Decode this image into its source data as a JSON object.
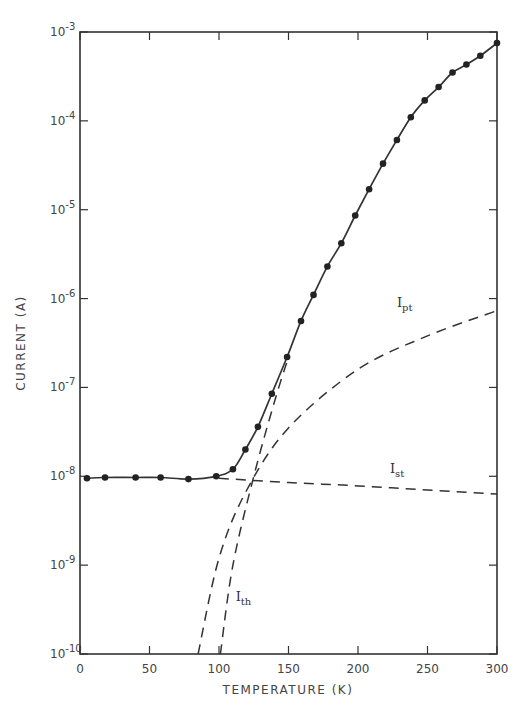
{
  "chart_data": {
    "type": "line",
    "title": "",
    "xlabel": "TEMPERATURE (K)",
    "ylabel": "CURRENT (A)",
    "xlim": [
      0,
      300
    ],
    "ylim": [
      1e-10,
      0.001
    ],
    "yscale": "log",
    "grid": false,
    "legend": "none (inline curve labels)",
    "x_ticks": [
      "0",
      "50",
      "100",
      "150",
      "200",
      "250",
      "300"
    ],
    "y_ticks": [
      {
        "base": "10",
        "exp": "-3"
      },
      {
        "base": "10",
        "exp": "-4"
      },
      {
        "base": "10",
        "exp": "-5"
      },
      {
        "base": "10",
        "exp": "-6"
      },
      {
        "base": "10",
        "exp": "-7"
      },
      {
        "base": "10",
        "exp": "-8"
      },
      {
        "base": "10",
        "exp": "-9"
      },
      {
        "base": "10",
        "exp": "-10"
      }
    ],
    "series": [
      {
        "name": "Measured (total current)",
        "style": "solid line with filled circle markers",
        "x": [
          5,
          18,
          40,
          58,
          78,
          98,
          110,
          119,
          128,
          138,
          149,
          159,
          168,
          178,
          188,
          198,
          208,
          218,
          228,
          238,
          248,
          258,
          268,
          278,
          288,
          300
        ],
        "y": [
          9.5e-09,
          9.7e-09,
          9.7e-09,
          9.7e-09,
          9.3e-09,
          1e-08,
          1.2e-08,
          2e-08,
          3.6e-08,
          8.5e-08,
          2.2e-07,
          5.6e-07,
          1.1e-06,
          2.3e-06,
          4.2e-06,
          8.6e-06,
          1.7e-05,
          3.3e-05,
          6.1e-05,
          0.00011,
          0.00017,
          0.00024,
          0.00035,
          0.00043,
          0.00054,
          0.00075
        ]
      },
      {
        "name": "I_st",
        "style": "dashed",
        "x": [
          100,
          150,
          200,
          250,
          300
        ],
        "y": [
          9.5e-09,
          8.5e-09,
          7.8e-09,
          7e-09,
          6.3e-09
        ]
      },
      {
        "name": "I_pt",
        "style": "dashed",
        "x": [
          85,
          100,
          120,
          150,
          200,
          250,
          300
        ],
        "y": [
          1e-10,
          1.2e-09,
          7e-09,
          3.5e-08,
          1.6e-07,
          3.8e-07,
          7.3e-07
        ]
      },
      {
        "name": "I_th",
        "style": "dashed",
        "x": [
          101,
          110,
          125,
          140,
          150
        ],
        "y": [
          1e-10,
          1e-09,
          1e-08,
          7e-08,
          2.2e-07
        ]
      }
    ],
    "annotations": [
      {
        "text": "I",
        "sub": "pt",
        "x": 228,
        "y": 8e-07
      },
      {
        "text": "I",
        "sub": "st",
        "x": 223,
        "y": 1.1e-08
      },
      {
        "text": "I",
        "sub": "th",
        "x": 112,
        "y": 4e-10
      }
    ]
  }
}
